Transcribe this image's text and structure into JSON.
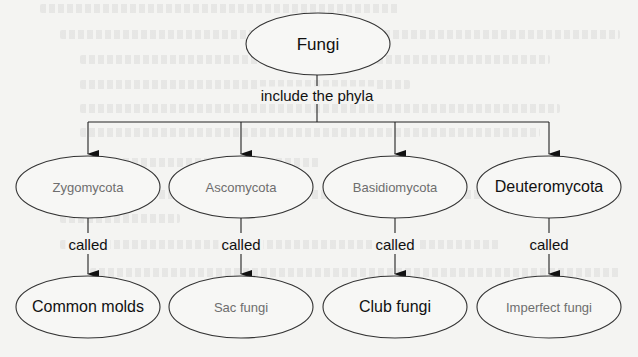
{
  "diagram": {
    "type": "concept-map",
    "colors": {
      "background": "#f4f4f2",
      "ellipse_stroke": "#333333",
      "printed_text": "#6e6e6e",
      "answer_text": "#111111"
    },
    "root": {
      "label": "Fungi",
      "cx": 318,
      "cy": 44,
      "rx": 72,
      "ry": 31
    },
    "root_link_label": "include the phyla",
    "phyla": [
      {
        "label": "Zygomycota",
        "style": "printed",
        "cx": 88,
        "cy": 187,
        "link_label": "called",
        "common_name": {
          "label": "Common molds",
          "style": "answer"
        }
      },
      {
        "label": "Ascomycota",
        "style": "printed",
        "cx": 241,
        "cy": 187,
        "link_label": "called",
        "common_name": {
          "label": "Sac fungi",
          "style": "printed"
        }
      },
      {
        "label": "Basidiomycota",
        "style": "printed",
        "cx": 395,
        "cy": 187,
        "link_label": "called",
        "common_name": {
          "label": "Club fungi",
          "style": "answer"
        }
      },
      {
        "label": "Deuteromycota",
        "style": "answer",
        "cx": 549,
        "cy": 187,
        "link_label": "called",
        "common_name": {
          "label": "Imperfect fungi",
          "style": "printed"
        }
      }
    ]
  }
}
